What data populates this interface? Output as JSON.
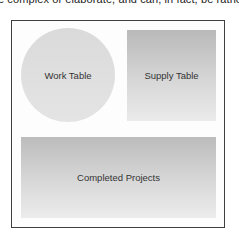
{
  "caption": "e complex or elaborate, and can, in fact, be rather s",
  "diagram": {
    "shapes": [
      {
        "id": "work-table",
        "shape": "circle",
        "label": "Work Table"
      },
      {
        "id": "supply-table",
        "shape": "rectangle",
        "label": "Supply Table"
      },
      {
        "id": "completed-projects",
        "shape": "rectangle",
        "label": "Completed Projects"
      }
    ]
  },
  "colors": {
    "frame_border": "#3f3f3f",
    "circle_fill": "#dadada",
    "rect_gradient_top": "#b9b9b9",
    "rect_gradient_bottom": "#ebebeb",
    "label_text": "#333333"
  }
}
